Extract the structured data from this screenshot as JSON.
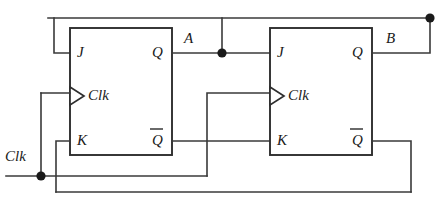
{
  "diagram": {
    "type": "digital-logic-schematic",
    "line_color": "#3a3a3a",
    "box_color": "#2e2e2e",
    "background": "#ffffff"
  },
  "flipflops": [
    {
      "id": "ff1",
      "inputs": {
        "j": "J",
        "clk": "Clk",
        "k": "K"
      },
      "outputs": {
        "q": "Q",
        "qbar": "Q"
      }
    },
    {
      "id": "ff2",
      "inputs": {
        "j": "J",
        "clk": "Clk",
        "k": "K"
      },
      "outputs": {
        "q": "Q",
        "qbar": "Q"
      }
    }
  ],
  "nets": {
    "a": "A",
    "b": "B",
    "clock_input": "Clk"
  }
}
